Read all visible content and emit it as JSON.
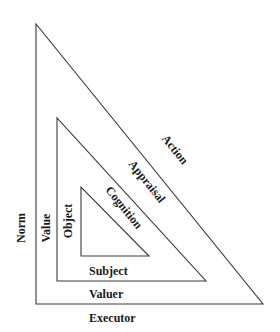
{
  "diagram": {
    "type": "nested-triangles",
    "stroke_color": "#3a3a3a",
    "text_color": "#1a1a1a",
    "triangles": [
      {
        "name": "outer",
        "points": "36,24 36,304 263,304",
        "left_label": "Norm",
        "bottom_label": "Executor",
        "hypotenuse_label": "Action"
      },
      {
        "name": "middle",
        "points": "57,118 57,281 206,281",
        "left_label": "Value",
        "bottom_label": "Valuer",
        "hypotenuse_label": "Appraisal"
      },
      {
        "name": "inner",
        "points": "81,187 81,256 149,256",
        "left_label": "Object",
        "bottom_label": "Subject",
        "hypotenuse_label": "Cognition"
      }
    ]
  }
}
